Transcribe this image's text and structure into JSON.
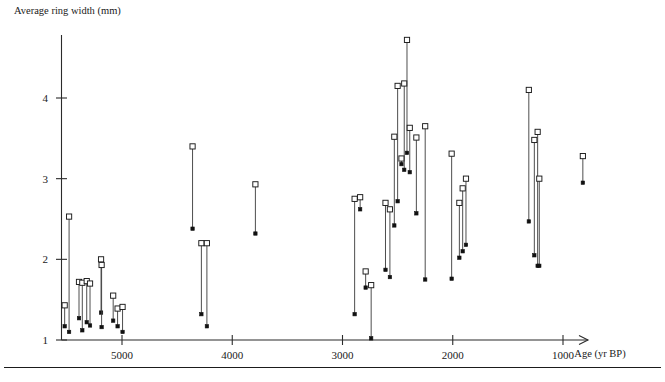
{
  "figure": {
    "y_axis_title": "Average ring width (mm)",
    "x_axis_title": "Age (yr BP)"
  },
  "chart_data": {
    "type": "scatter",
    "title": "",
    "xlabel": "Age (yr BP)",
    "ylabel": "Average ring width (mm)",
    "xlim": [
      5600,
      650
    ],
    "ylim": [
      1,
      4.9
    ],
    "x_reversed": true,
    "grid": false,
    "legend": null,
    "xticks": [
      5000,
      4000,
      3000,
      2000,
      1000
    ],
    "xtick_labels": [
      "5000",
      "4000",
      "3000",
      "2000",
      "1000"
    ],
    "yticks": [
      1,
      2,
      3,
      4
    ],
    "ytick_labels": [
      "1",
      "2",
      "3",
      "4"
    ],
    "series": [
      {
        "name": "open-square-max",
        "marker": "open-square",
        "description": "upper value of each site range"
      },
      {
        "name": "filled-square-min",
        "marker": "filled-square",
        "description": "lower value of each site range"
      },
      {
        "name": "range-connector",
        "marker": "line",
        "description": "vertical line joining the pair"
      }
    ],
    "points": [
      {
        "age": 5520,
        "upper": 1.43,
        "lower": 1.17
      },
      {
        "age": 5480,
        "upper": 2.53,
        "lower": 1.1
      },
      {
        "age": 5390,
        "upper": 1.72,
        "lower": 1.27
      },
      {
        "age": 5360,
        "upper": 1.71,
        "lower": 1.12
      },
      {
        "age": 5320,
        "upper": 1.73,
        "lower": 1.22
      },
      {
        "age": 5290,
        "upper": 1.7,
        "lower": 1.18
      },
      {
        "age": 5190,
        "upper": 2.0,
        "lower": 1.34
      },
      {
        "age": 5185,
        "upper": 1.93,
        "lower": 1.16
      },
      {
        "age": 5080,
        "upper": 1.55,
        "lower": 1.24
      },
      {
        "age": 5040,
        "upper": 1.39,
        "lower": 1.17
      },
      {
        "age": 4995,
        "upper": 1.41,
        "lower": 1.1
      },
      {
        "age": 4360,
        "upper": 3.4,
        "lower": 2.38
      },
      {
        "age": 4280,
        "upper": 2.2,
        "lower": 1.32
      },
      {
        "age": 4230,
        "upper": 2.2,
        "lower": 1.17
      },
      {
        "age": 3790,
        "upper": 2.93,
        "lower": 2.32
      },
      {
        "age": 2890,
        "upper": 2.75,
        "lower": 1.32
      },
      {
        "age": 2840,
        "upper": 2.77,
        "lower": 2.62
      },
      {
        "age": 2790,
        "upper": 1.85,
        "lower": 1.65
      },
      {
        "age": 2740,
        "upper": 1.68,
        "lower": 1.02
      },
      {
        "age": 2610,
        "upper": 2.7,
        "lower": 1.87
      },
      {
        "age": 2570,
        "upper": 2.62,
        "lower": 1.78
      },
      {
        "age": 2530,
        "upper": 3.52,
        "lower": 2.42
      },
      {
        "age": 2500,
        "upper": 4.15,
        "lower": 2.72
      },
      {
        "age": 2465,
        "upper": 3.25,
        "lower": 3.18
      },
      {
        "age": 2440,
        "upper": 4.18,
        "lower": 3.11
      },
      {
        "age": 2415,
        "upper": 4.72,
        "lower": 3.32
      },
      {
        "age": 2390,
        "upper": 3.63,
        "lower": 3.08
      },
      {
        "age": 2330,
        "upper": 3.51,
        "lower": 2.57
      },
      {
        "age": 2250,
        "upper": 3.65,
        "lower": 1.75
      },
      {
        "age": 2010,
        "upper": 3.31,
        "lower": 1.76
      },
      {
        "age": 1940,
        "upper": 2.7,
        "lower": 2.02
      },
      {
        "age": 1910,
        "upper": 2.88,
        "lower": 2.1
      },
      {
        "age": 1880,
        "upper": 3.0,
        "lower": 2.18
      },
      {
        "age": 1310,
        "upper": 4.1,
        "lower": 2.47
      },
      {
        "age": 1260,
        "upper": 3.48,
        "lower": 2.05
      },
      {
        "age": 1230,
        "upper": 3.58,
        "lower": 1.92
      },
      {
        "age": 1215,
        "upper": 3.0,
        "lower": 1.92
      },
      {
        "age": 820,
        "upper": 3.28,
        "lower": 2.95
      }
    ]
  }
}
